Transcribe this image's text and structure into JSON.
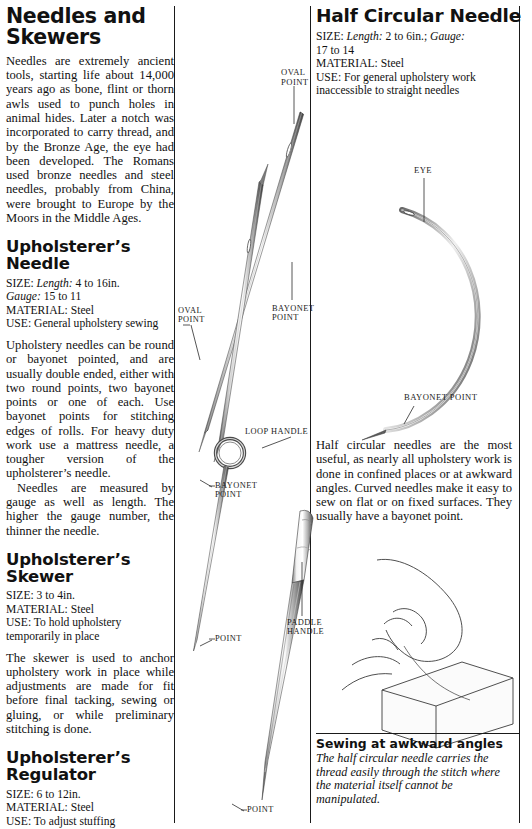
{
  "document": {
    "title": "Needles and Skewers",
    "intro": "Needles are extremely ancient tools, starting life about 14,000 years ago as bone, flint or thorn awls used to punch holes in animal hides. Later a notch was incorporated to carry thread, and by the Bronze Age, the eye had been developed. The Romans used bronze needles and steel needles, probably from China, were brought to Europe by the Moors in the Middle Ages."
  },
  "sections": {
    "upholsterers_needle": {
      "heading": "Upholsterer’s Needle",
      "spec": {
        "size_label": "SIZE:",
        "size_sub_label": "Length:",
        "size_value": "4 to 16in.",
        "gauge_label": "Gauge:",
        "gauge_value": "15 to 11",
        "material_label": "MATERIAL:",
        "material_value": "Steel",
        "use_label": "USE:",
        "use_value": "General upholstery sewing"
      },
      "paragraph_1": "Upholstery needles can be round or bayonet pointed, and are usually double ended, either with two round points, two bayonet points or one of each. Use bayonet points for stitching edges of rolls. For heavy duty work use a mattress needle, a tougher version of the upholsterer’s needle.",
      "paragraph_2": "Needles are measured by gauge as well as length. The higher the gauge number, the thinner the needle."
    },
    "upholsterers_skewer": {
      "heading": "Upholsterer’s Skewer",
      "spec": {
        "size_label": "SIZE:",
        "size_value": "3 to 4in.",
        "material_label": "MATERIAL:",
        "material_value": "Steel",
        "use_label": "USE:",
        "use_value": "To hold upholstery temporarily in place"
      },
      "paragraph_1": "The skewer is used to anchor upholstery work in place while adjustments are made for fit before final tacking, sewing or gluing, or while preliminary stitching is done."
    },
    "upholsterers_regulator": {
      "heading": "Upholsterer’s Regulator",
      "spec": {
        "size_label": "SIZE:",
        "size_value": "6 to 12in.",
        "material_label": "MATERIAL:",
        "material_value": "Steel",
        "use_label": "USE:",
        "use_value": "To adjust stuffing"
      },
      "paragraph_1": "The upholsterer’s regulator is spiked at one end and paddle-shaped at the other to make it easy to hold. It is poked through the burlap covering and used to smooth out or redistribute the stuffing."
    },
    "half_circular_needle": {
      "heading": "Half Circular Needle",
      "spec": {
        "size_label": "SIZE:",
        "size_sub_label": "Length:",
        "size_value": "2 to 6in.;",
        "gauge_label": "Gauge:",
        "gauge_value": "17 to 14",
        "material_label": "MATERIAL:",
        "material_value": "Steel",
        "use_label": "USE:",
        "use_value": "For general upholstery work inaccessible to straight needles"
      },
      "paragraph_1": "Half circular needles are the most useful, as nearly all upholstery work is done in confined places or at awkward angles. Curved needles make it easy to sew on flat or on fixed surfaces. They usually have a bayonet point.",
      "caption_title": "Sewing at awkward angles",
      "caption_body": "The half circular needle carries the thread easily through the stitch where the material itself cannot be manipulated."
    }
  },
  "diagram_labels": {
    "oval_point_top": "OVAL\nPOINT",
    "oval_point_mid": "OVAL\nPOINT",
    "bayonet_point_mid": "BAYONET\nPOINT",
    "loop_handle": "LOOP HANDLE",
    "bayonet_point_skewer": "BAYONET\nPOINT",
    "point_skewer": "POINT",
    "paddle_handle": "PADDLE\nHANDLE",
    "point_regulator": "POINT",
    "eye": "EYE",
    "bayonet_point_curved": "BAYONET POINT"
  },
  "colors": {
    "ink": "#111111",
    "rule": "#1a1a1a",
    "paper": "#ffffff",
    "metal_light": "#f2f2f2",
    "metal_mid": "#9a9a9a",
    "metal_dark": "#3a3a3a"
  }
}
